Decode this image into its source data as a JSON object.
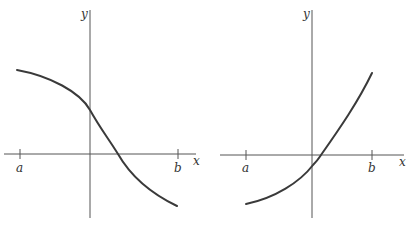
{
  "figures": [
    {
      "id": "left",
      "axis_labels": {
        "x": "x",
        "y": "y"
      },
      "tick_labels": {
        "a": "a",
        "b": "b"
      },
      "description": "Decreasing curve from a to b, positive at a, crossing y-axis above origin, crossing x-axis right of origin, negative at b",
      "curve_path": "M17,70 C50,76 80,92 90,110 C100,128 108,138 118,154 C130,175 150,193 177,206"
    },
    {
      "id": "right",
      "axis_labels": {
        "x": "x",
        "y": "y"
      },
      "tick_labels": {
        "a": "a",
        "b": "b"
      },
      "description": "Increasing concave-up curve from a to b, negative at a, crossing y-axis just below origin, crossing x-axis just right of origin, positive at b",
      "curve_path": "M246,204 C275,198 300,182 313,165 C318,160 319,158 321,155 C340,128 358,102 372,73"
    }
  ],
  "colors": {
    "axis": "#555555",
    "curve": "#3a3a3a",
    "background": "#ffffff"
  }
}
